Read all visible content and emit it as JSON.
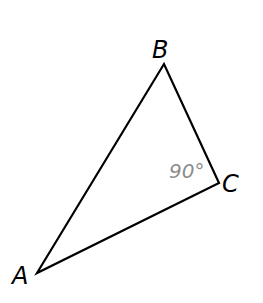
{
  "diagram": {
    "type": "right-triangle",
    "vertices": [
      {
        "label": "A",
        "x": 37,
        "y": 273
      },
      {
        "label": "B",
        "x": 164,
        "y": 64
      },
      {
        "label": "C",
        "x": 219,
        "y": 183
      }
    ],
    "angle": {
      "vertex": "C",
      "label": "90°",
      "color": "#8c8c8c"
    },
    "line_color": "#000000",
    "label_color": "#000000"
  }
}
